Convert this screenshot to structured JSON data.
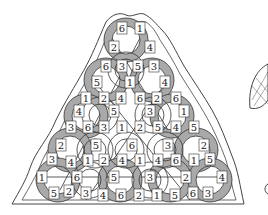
{
  "diagram": {
    "colors": {
      "ring_gray": "#a9a9a9",
      "ring_dark": "#555555",
      "ring_white": "#ffffff",
      "stroke": "#333333",
      "outline": "#444444"
    },
    "gray_rings": [
      {
        "cx": 126,
        "cy": 40,
        "r": 22
      },
      {
        "cx": 106,
        "cy": 80,
        "r": 22
      },
      {
        "cx": 152,
        "cy": 80,
        "r": 22
      },
      {
        "cx": 86,
        "cy": 116,
        "r": 22
      },
      {
        "cx": 172,
        "cy": 116,
        "r": 22
      },
      {
        "cx": 70,
        "cy": 150,
        "r": 22
      },
      {
        "cx": 196,
        "cy": 150,
        "r": 22
      },
      {
        "cx": 58,
        "cy": 180,
        "r": 22
      },
      {
        "cx": 120,
        "cy": 180,
        "r": 22
      },
      {
        "cx": 170,
        "cy": 180,
        "r": 22
      },
      {
        "cx": 210,
        "cy": 180,
        "r": 22
      }
    ],
    "white_rings": [
      {
        "cx": 126,
        "cy": 70,
        "r": 18
      },
      {
        "cx": 100,
        "cy": 115,
        "r": 18
      },
      {
        "cx": 153,
        "cy": 115,
        "r": 18
      },
      {
        "cx": 126,
        "cy": 150,
        "r": 18
      },
      {
        "cx": 95,
        "cy": 150,
        "r": 18
      },
      {
        "cx": 165,
        "cy": 150,
        "r": 18
      },
      {
        "cx": 90,
        "cy": 180,
        "r": 18
      },
      {
        "cx": 150,
        "cy": 180,
        "r": 18
      }
    ],
    "labels": [
      {
        "x": 122,
        "y": 28,
        "t": "6"
      },
      {
        "x": 140,
        "y": 28,
        "t": "1"
      },
      {
        "x": 114,
        "y": 47,
        "t": "2"
      },
      {
        "x": 150,
        "y": 47,
        "t": "4"
      },
      {
        "x": 106,
        "y": 66,
        "t": "6"
      },
      {
        "x": 122,
        "y": 66,
        "t": "3"
      },
      {
        "x": 138,
        "y": 66,
        "t": "5"
      },
      {
        "x": 154,
        "y": 66,
        "t": "3"
      },
      {
        "x": 97,
        "y": 82,
        "t": "5"
      },
      {
        "x": 130,
        "y": 82,
        "t": "1"
      },
      {
        "x": 165,
        "y": 82,
        "t": "4"
      },
      {
        "x": 86,
        "y": 98,
        "t": "1"
      },
      {
        "x": 104,
        "y": 98,
        "t": "2"
      },
      {
        "x": 121,
        "y": 98,
        "t": "4"
      },
      {
        "x": 140,
        "y": 98,
        "t": "6"
      },
      {
        "x": 157,
        "y": 98,
        "t": "2"
      },
      {
        "x": 176,
        "y": 98,
        "t": "6"
      },
      {
        "x": 79,
        "y": 111,
        "t": "4"
      },
      {
        "x": 114,
        "y": 111,
        "t": "5"
      },
      {
        "x": 150,
        "y": 111,
        "t": "3"
      },
      {
        "x": 184,
        "y": 111,
        "t": "1"
      },
      {
        "x": 71,
        "y": 127,
        "t": "3"
      },
      {
        "x": 88,
        "y": 127,
        "t": "6"
      },
      {
        "x": 104,
        "y": 127,
        "t": "3"
      },
      {
        "x": 122,
        "y": 127,
        "t": "1"
      },
      {
        "x": 140,
        "y": 127,
        "t": "2"
      },
      {
        "x": 158,
        "y": 127,
        "t": "5"
      },
      {
        "x": 176,
        "y": 127,
        "t": "4"
      },
      {
        "x": 194,
        "y": 127,
        "t": "5"
      },
      {
        "x": 61,
        "y": 145,
        "t": "2"
      },
      {
        "x": 96,
        "y": 145,
        "t": "5"
      },
      {
        "x": 132,
        "y": 145,
        "t": "6"
      },
      {
        "x": 168,
        "y": 145,
        "t": "3"
      },
      {
        "x": 204,
        "y": 145,
        "t": "2"
      },
      {
        "x": 52,
        "y": 159,
        "t": "3"
      },
      {
        "x": 71,
        "y": 162,
        "t": "4"
      },
      {
        "x": 88,
        "y": 160,
        "t": "1"
      },
      {
        "x": 104,
        "y": 160,
        "t": "2"
      },
      {
        "x": 122,
        "y": 160,
        "t": "4"
      },
      {
        "x": 140,
        "y": 160,
        "t": "1"
      },
      {
        "x": 158,
        "y": 160,
        "t": "4"
      },
      {
        "x": 176,
        "y": 160,
        "t": "6"
      },
      {
        "x": 194,
        "y": 160,
        "t": "1"
      },
      {
        "x": 210,
        "y": 159,
        "t": "5"
      },
      {
        "x": 42,
        "y": 177,
        "t": "1"
      },
      {
        "x": 77,
        "y": 177,
        "t": "6"
      },
      {
        "x": 114,
        "y": 177,
        "t": "5"
      },
      {
        "x": 150,
        "y": 177,
        "t": "3"
      },
      {
        "x": 186,
        "y": 177,
        "t": "2"
      },
      {
        "x": 222,
        "y": 177,
        "t": "4"
      },
      {
        "x": 54,
        "y": 193,
        "t": "5"
      },
      {
        "x": 69,
        "y": 191,
        "t": "2"
      },
      {
        "x": 86,
        "y": 193,
        "t": "3"
      },
      {
        "x": 103,
        "y": 195,
        "t": "4"
      },
      {
        "x": 121,
        "y": 195,
        "t": "6"
      },
      {
        "x": 139,
        "y": 195,
        "t": "2"
      },
      {
        "x": 157,
        "y": 195,
        "t": "1"
      },
      {
        "x": 175,
        "y": 195,
        "t": "5"
      },
      {
        "x": 193,
        "y": 193,
        "t": "6"
      },
      {
        "x": 208,
        "y": 193,
        "t": "3"
      }
    ]
  }
}
